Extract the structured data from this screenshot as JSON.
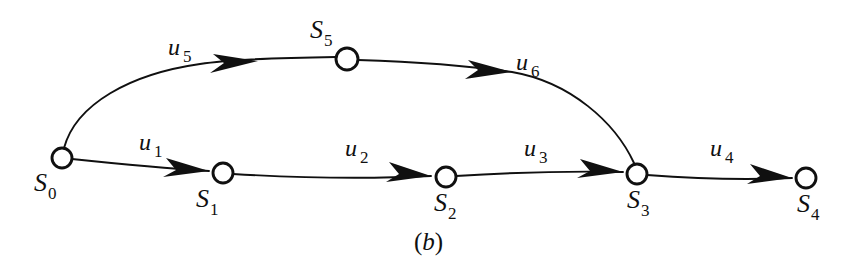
{
  "figure": {
    "caption_open": "(",
    "caption_letter": "b",
    "caption_close": ")",
    "caption_full": "(b)",
    "background_color": "#ffffff",
    "ink_color": "#101010"
  },
  "graph": {
    "type": "directed-state-transition-graph",
    "node_count": 6,
    "edge_count": 6,
    "nodes": [
      {
        "id": "s0",
        "base": "S",
        "sub": "0",
        "label": "S0",
        "cx": 62,
        "cy": 158,
        "r": 10
      },
      {
        "id": "s1",
        "base": "S",
        "sub": "1",
        "label": "S1",
        "cx": 223,
        "cy": 173,
        "r": 10
      },
      {
        "id": "s2",
        "base": "S",
        "sub": "2",
        "label": "S2",
        "cx": 446,
        "cy": 177,
        "r": 10
      },
      {
        "id": "s3",
        "base": "S",
        "sub": "3",
        "label": "S3",
        "cx": 637,
        "cy": 174,
        "r": 10
      },
      {
        "id": "s4",
        "base": "S",
        "sub": "4",
        "label": "S4",
        "cx": 806,
        "cy": 178,
        "r": 10
      },
      {
        "id": "s5",
        "base": "S",
        "sub": "5",
        "label": "S5",
        "cx": 347,
        "cy": 59,
        "r": 11
      }
    ],
    "edges": [
      {
        "id": "u1",
        "base": "u",
        "sub": "1",
        "label": "u1",
        "from": "s0",
        "to": "s1"
      },
      {
        "id": "u2",
        "base": "u",
        "sub": "2",
        "label": "u2",
        "from": "s1",
        "to": "s2"
      },
      {
        "id": "u3",
        "base": "u",
        "sub": "3",
        "label": "u3",
        "from": "s2",
        "to": "s3"
      },
      {
        "id": "u4",
        "base": "u",
        "sub": "4",
        "label": "u4",
        "from": "s3",
        "to": "s4"
      },
      {
        "id": "u5",
        "base": "u",
        "sub": "5",
        "label": "u5",
        "from": "s0",
        "to": "s5"
      },
      {
        "id": "u6",
        "base": "u",
        "sub": "6",
        "label": "u6",
        "from": "s5",
        "to": "s3"
      }
    ]
  },
  "node_labels": {
    "s0": {
      "base": "S",
      "sub": "0",
      "x": 34,
      "y": 170
    },
    "s1": {
      "base": "S",
      "sub": "1",
      "x": 196,
      "y": 186
    },
    "s2": {
      "base": "S",
      "sub": "2",
      "x": 434,
      "y": 190
    },
    "s3": {
      "base": "S",
      "sub": "3",
      "x": 627,
      "y": 187
    },
    "s4": {
      "base": "S",
      "sub": "4",
      "x": 797,
      "y": 191
    },
    "s5": {
      "base": "S",
      "sub": "5",
      "x": 310,
      "y": 17
    }
  },
  "edge_labels": {
    "u1": {
      "base": "u",
      "sub": "1",
      "x": 139,
      "y": 130
    },
    "u2": {
      "base": "u",
      "sub": "2",
      "x": 345,
      "y": 136
    },
    "u3": {
      "base": "u",
      "sub": "3",
      "x": 524,
      "y": 136
    },
    "u4": {
      "base": "u",
      "sub": "4",
      "x": 710,
      "y": 136
    },
    "u5": {
      "base": "u",
      "sub": "5",
      "x": 168,
      "y": 35
    },
    "u6": {
      "base": "u",
      "sub": "6",
      "x": 516,
      "y": 50
    }
  }
}
